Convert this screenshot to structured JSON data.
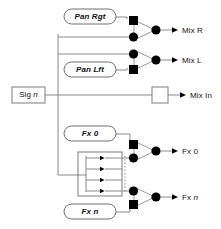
{
  "diagram": {
    "colors": {
      "wire": "#8a8a8a",
      "node": "#000000",
      "outline": "#7d7d7d",
      "background": "#ffffff",
      "text": "#111111"
    },
    "source": {
      "label": "Sig n",
      "label_text": "Sig ",
      "label_italic": "n"
    },
    "controls": [
      {
        "id": "pan-rgt",
        "label": "Pan Rgt"
      },
      {
        "id": "pan-lft",
        "label": "Pan Lft"
      },
      {
        "id": "fx-0",
        "label": "Fx 0"
      },
      {
        "id": "fx-n",
        "label": "Fx n"
      }
    ],
    "outputs": [
      {
        "id": "mix-r",
        "label": "Mix R",
        "kind": "mixer"
      },
      {
        "id": "mix-l",
        "label": "Mix L",
        "kind": "mixer"
      },
      {
        "id": "mix-in",
        "label": "Mix In",
        "kind": "passthrough"
      },
      {
        "id": "fx-0",
        "label": "Fx 0",
        "kind": "mixer"
      },
      {
        "id": "fx-n",
        "label": "Fx n",
        "kind": "mixer"
      }
    ],
    "bus": {
      "id": "fx-send-bus",
      "tap_count": 4,
      "continuation": "dotted"
    }
  }
}
